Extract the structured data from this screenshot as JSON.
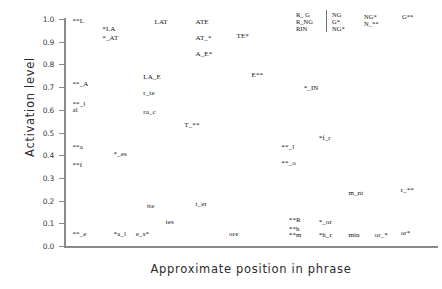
{
  "chart_data": {
    "type": "scatter",
    "title": "",
    "xlabel": "Approximate position in phrase",
    "ylabel": "Activation level",
    "xlim": [
      0,
      1
    ],
    "ylim": [
      0.0,
      1.0
    ],
    "grid": false,
    "legend_position": "top-right",
    "ytick_labels": [
      "1.0",
      "0.9",
      "0.8",
      "0.7",
      "0.6",
      "0.5",
      "0.4",
      "0.3",
      "0.2",
      "0.1",
      "0.0"
    ],
    "ytick_values": [
      1.0,
      0.9,
      0.8,
      0.7,
      0.6,
      0.5,
      0.4,
      0.3,
      0.2,
      0.1,
      0.0
    ],
    "xtick_labels": [],
    "note": "Each data point is rendered as its own text label; asterisks mark the plotted marker positions.",
    "points": [
      {
        "label": "**L",
        "x": 0.02,
        "y": 0.99
      },
      {
        "label": "*LA",
        "x": 0.1,
        "y": 0.955
      },
      {
        "label": "LAT",
        "x": 0.24,
        "y": 0.985
      },
      {
        "label": "ATE",
        "x": 0.35,
        "y": 0.985
      },
      {
        "label": "*_AT",
        "x": 0.1,
        "y": 0.915
      },
      {
        "label": "AT_*",
        "x": 0.35,
        "y": 0.915
      },
      {
        "label": "TE*",
        "x": 0.46,
        "y": 0.925
      },
      {
        "label": "A_E*",
        "x": 0.35,
        "y": 0.845
      },
      {
        "label": "E**",
        "x": 0.5,
        "y": 0.755
      },
      {
        "label": "**_A",
        "x": 0.02,
        "y": 0.715
      },
      {
        "label": "LA_E",
        "x": 0.21,
        "y": 0.745
      },
      {
        "label": "r_te",
        "x": 0.21,
        "y": 0.675
      },
      {
        "label": "**_l",
        "x": 0.02,
        "y": 0.625
      },
      {
        "label": "al",
        "x": 0.02,
        "y": 0.598
      },
      {
        "label": "ra_c",
        "x": 0.21,
        "y": 0.592
      },
      {
        "label": "*_IN",
        "x": 0.64,
        "y": 0.695
      },
      {
        "label": "T_**",
        "x": 0.32,
        "y": 0.535
      },
      {
        "label": "*f_r",
        "x": 0.68,
        "y": 0.475
      },
      {
        "label": "**_l",
        "x": 0.58,
        "y": 0.435
      },
      {
        "label": "**a",
        "x": 0.02,
        "y": 0.435
      },
      {
        "label": "*_es",
        "x": 0.13,
        "y": 0.405
      },
      {
        "label": "**_o",
        "x": 0.58,
        "y": 0.365
      },
      {
        "label": "**f",
        "x": 0.02,
        "y": 0.355
      },
      {
        "label": "m_nt",
        "x": 0.76,
        "y": 0.235
      },
      {
        "label": "r_**",
        "x": 0.9,
        "y": 0.245
      },
      {
        "label": "tte",
        "x": 0.22,
        "y": 0.175
      },
      {
        "label": "t_er",
        "x": 0.35,
        "y": 0.185
      },
      {
        "label": "tes",
        "x": 0.27,
        "y": 0.105
      },
      {
        "label": "**R",
        "x": 0.6,
        "y": 0.115
      },
      {
        "label": "*_or",
        "x": 0.68,
        "y": 0.105
      },
      {
        "label": "**h",
        "x": 0.6,
        "y": 0.075
      },
      {
        "label": "e_s*",
        "x": 0.19,
        "y": 0.055
      },
      {
        "label": "ore",
        "x": 0.44,
        "y": 0.055
      },
      {
        "label": "**m",
        "x": 0.6,
        "y": 0.048
      },
      {
        "label": "*h_r",
        "x": 0.68,
        "y": 0.048
      },
      {
        "label": "min",
        "x": 0.76,
        "y": 0.048
      },
      {
        "label": "or_*",
        "x": 0.83,
        "y": 0.048
      },
      {
        "label": "or*",
        "x": 0.9,
        "y": 0.058
      },
      {
        "label": "**_e",
        "x": 0.02,
        "y": 0.055
      },
      {
        "label": "*a_l",
        "x": 0.13,
        "y": 0.055
      }
    ]
  },
  "legend": {
    "columns": [
      {
        "lines": [
          "R_ G",
          "R_NG",
          "RIN"
        ]
      },
      {
        "lines": [
          "NG",
          "G*",
          "NG*"
        ]
      },
      {
        "lines": [
          "NG*",
          "N_**"
        ]
      },
      {
        "lines": [
          "G**"
        ]
      }
    ]
  }
}
